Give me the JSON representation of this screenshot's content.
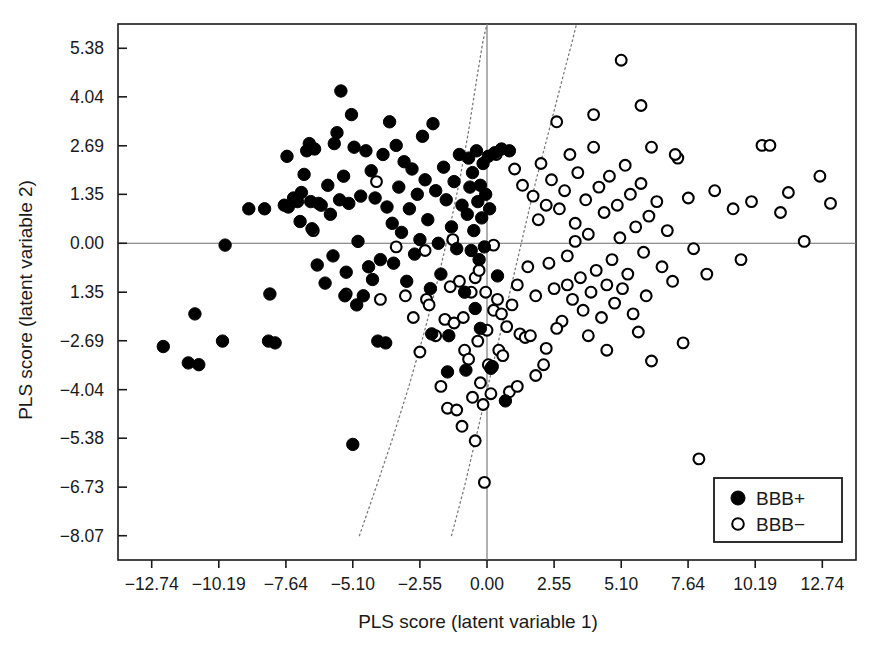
{
  "chart_data": {
    "type": "scatter",
    "title": "",
    "xlabel": "PLS score (latent variable 1)",
    "ylabel": "PLS score (latent variable 2)",
    "xlim": [
      -14.02,
      14.02
    ],
    "ylim": [
      -8.74,
      6.05
    ],
    "xticks": [
      -12.74,
      -10.19,
      -7.64,
      -5.1,
      -2.55,
      0.0,
      2.55,
      5.1,
      7.64,
      10.19,
      12.74
    ],
    "xticklabels": [
      "−12.74",
      "−10.19",
      "−7.64",
      "−5.10",
      "−2.55",
      "0.00",
      "2.55",
      "5.10",
      "7.64",
      "10.19",
      "12.74"
    ],
    "yticks": [
      5.38,
      4.04,
      2.69,
      1.35,
      0.0,
      -1.35,
      -2.69,
      -4.04,
      -5.38,
      -6.73,
      -8.07
    ],
    "yticklabels": [
      "5.38",
      "4.04",
      "2.69",
      "1.35",
      "0.00",
      "1.35",
      "−2.69",
      "−4.04",
      "−5.38",
      "−6.73",
      "−8.07"
    ],
    "grid": false,
    "zero_lines": {
      "x": 0.0,
      "y": 0.0
    },
    "legend_position": "lower-right",
    "series": [
      {
        "name": "BBB+",
        "marker": "filled-circle",
        "color": "#000000",
        "points": [
          [
            -12.3,
            -2.85
          ],
          [
            -11.35,
            -3.3
          ],
          [
            -11.1,
            -1.95
          ],
          [
            -10.95,
            -3.35
          ],
          [
            -10.05,
            -2.7
          ],
          [
            -9.95,
            -0.05
          ],
          [
            -9.05,
            0.95
          ],
          [
            -8.45,
            0.95
          ],
          [
            -8.3,
            -2.7
          ],
          [
            -8.25,
            -1.4
          ],
          [
            -8.05,
            -2.75
          ],
          [
            -7.7,
            1.05
          ],
          [
            -7.6,
            2.4
          ],
          [
            -7.55,
            1.0
          ],
          [
            -7.35,
            1.25
          ],
          [
            -7.2,
            1.15
          ],
          [
            -7.1,
            0.6
          ],
          [
            -7.05,
            1.4
          ],
          [
            -6.95,
            1.9
          ],
          [
            -6.85,
            2.55
          ],
          [
            -6.75,
            2.75
          ],
          [
            -6.7,
            1.15
          ],
          [
            -6.65,
            0.4
          ],
          [
            -6.55,
            2.6
          ],
          [
            -6.45,
            -0.6
          ],
          [
            -6.4,
            1.1
          ],
          [
            -6.3,
            1.05
          ],
          [
            -6.15,
            -1.1
          ],
          [
            -6.05,
            1.6
          ],
          [
            -5.95,
            0.8
          ],
          [
            -5.85,
            -0.35
          ],
          [
            -5.8,
            2.75
          ],
          [
            -5.7,
            3.05
          ],
          [
            -5.6,
            1.2
          ],
          [
            -5.55,
            4.2
          ],
          [
            -5.45,
            1.85
          ],
          [
            -5.4,
            -1.45
          ],
          [
            -5.35,
            -0.8
          ],
          [
            -5.25,
            1.1
          ],
          [
            -5.15,
            3.55
          ],
          [
            -5.1,
            -5.55
          ],
          [
            -5.05,
            2.65
          ],
          [
            -4.95,
            -1.7
          ],
          [
            -4.9,
            0.05
          ],
          [
            -4.8,
            1.3
          ],
          [
            -4.7,
            -1.45
          ],
          [
            -4.6,
            2.55
          ],
          [
            -4.5,
            -0.65
          ],
          [
            -4.4,
            2.0
          ],
          [
            -4.35,
            -1.0
          ],
          [
            -4.25,
            1.25
          ],
          [
            -4.15,
            -2.7
          ],
          [
            -4.05,
            -0.45
          ],
          [
            -3.95,
            2.45
          ],
          [
            -3.85,
            -2.75
          ],
          [
            -3.8,
            1.0
          ],
          [
            -3.7,
            3.35
          ],
          [
            -3.6,
            0.55
          ],
          [
            -3.55,
            -0.55
          ],
          [
            -3.45,
            2.7
          ],
          [
            -3.35,
            1.55
          ],
          [
            -3.25,
            0.3
          ],
          [
            -3.15,
            2.25
          ],
          [
            -3.05,
            -1.05
          ],
          [
            -2.95,
            0.95
          ],
          [
            -2.85,
            2.05
          ],
          [
            -2.75,
            -0.3
          ],
          [
            -2.65,
            1.35
          ],
          [
            -2.55,
            0.1
          ],
          [
            -2.45,
            2.95
          ],
          [
            -2.35,
            1.75
          ],
          [
            -2.25,
            0.65
          ],
          [
            -2.15,
            -1.25
          ],
          [
            -2.05,
            3.3
          ],
          [
            -1.95,
            1.45
          ],
          [
            -1.85,
            0.0
          ],
          [
            -1.75,
            -0.85
          ],
          [
            -1.65,
            2.1
          ],
          [
            -1.55,
            1.2
          ],
          [
            -1.45,
            -2.55
          ],
          [
            -1.35,
            0.45
          ],
          [
            -1.25,
            1.7
          ],
          [
            -1.15,
            -0.15
          ],
          [
            -1.05,
            2.45
          ],
          [
            -0.95,
            1.05
          ],
          [
            -0.85,
            -1.35
          ],
          [
            -0.75,
            0.8
          ],
          [
            -0.7,
            2.35
          ],
          [
            -0.65,
            1.55
          ],
          [
            -0.6,
            -0.2
          ],
          [
            -0.55,
            1.95
          ],
          [
            -0.5,
            0.35
          ],
          [
            -0.45,
            -1.8
          ],
          [
            -0.4,
            2.55
          ],
          [
            -0.35,
            1.15
          ],
          [
            -0.3,
            -0.45
          ],
          [
            -0.25,
            1.6
          ],
          [
            -0.2,
            0.7
          ],
          [
            -0.15,
            2.2
          ],
          [
            -0.1,
            -0.1
          ],
          [
            -0.05,
            1.35
          ],
          [
            0.05,
            2.4
          ],
          [
            0.1,
            0.95
          ],
          [
            0.2,
            -3.4
          ],
          [
            0.3,
            2.5
          ],
          [
            0.4,
            -0.9
          ],
          [
            0.55,
            2.6
          ],
          [
            0.7,
            -4.35
          ],
          [
            0.85,
            2.55
          ],
          [
            -1.5,
            -3.55
          ],
          [
            -0.8,
            -3.5
          ],
          [
            0.15,
            -3.45
          ],
          [
            -2.1,
            -2.5
          ],
          [
            -0.25,
            -2.35
          ]
        ]
      },
      {
        "name": "BBB−",
        "marker": "open-circle",
        "color": "#000000",
        "points": [
          [
            -5.35,
            -1.4
          ],
          [
            -4.2,
            1.7
          ],
          [
            -3.1,
            -1.45
          ],
          [
            -2.35,
            -0.2
          ],
          [
            -2.3,
            -1.55
          ],
          [
            -2.2,
            -1.7
          ],
          [
            -1.75,
            -3.95
          ],
          [
            -1.6,
            -2.1
          ],
          [
            -1.5,
            -4.55
          ],
          [
            -1.3,
            0.1
          ],
          [
            -1.25,
            -2.2
          ],
          [
            -1.15,
            -4.6
          ],
          [
            -0.95,
            -5.05
          ],
          [
            -0.85,
            -2.95
          ],
          [
            -0.7,
            -3.2
          ],
          [
            -0.6,
            -1.35
          ],
          [
            -0.55,
            -4.25
          ],
          [
            -0.45,
            -5.45
          ],
          [
            -0.35,
            -2.7
          ],
          [
            -0.25,
            -3.85
          ],
          [
            -0.15,
            -4.45
          ],
          [
            -0.1,
            -6.6
          ],
          [
            0.0,
            -2.4
          ],
          [
            0.05,
            -3.35
          ],
          [
            0.15,
            -4.15
          ],
          [
            0.25,
            -1.85
          ],
          [
            0.35,
            2.45
          ],
          [
            0.45,
            -2.95
          ],
          [
            0.6,
            -3.1
          ],
          [
            0.75,
            -2.3
          ],
          [
            0.85,
            -4.1
          ],
          [
            0.95,
            -1.7
          ],
          [
            1.05,
            2.05
          ],
          [
            1.15,
            -1.15
          ],
          [
            1.25,
            -2.5
          ],
          [
            1.35,
            1.6
          ],
          [
            1.45,
            -2.6
          ],
          [
            1.55,
            -0.65
          ],
          [
            1.65,
            -2.55
          ],
          [
            1.75,
            1.3
          ],
          [
            1.85,
            -1.45
          ],
          [
            1.95,
            0.65
          ],
          [
            2.05,
            2.2
          ],
          [
            2.15,
            -3.35
          ],
          [
            2.25,
            1.05
          ],
          [
            2.35,
            -0.55
          ],
          [
            2.45,
            1.75
          ],
          [
            2.55,
            -1.25
          ],
          [
            2.65,
            3.35
          ],
          [
            2.75,
            0.95
          ],
          [
            2.85,
            -2.15
          ],
          [
            2.95,
            1.45
          ],
          [
            3.05,
            -0.35
          ],
          [
            3.15,
            2.45
          ],
          [
            3.25,
            -1.55
          ],
          [
            3.35,
            0.55
          ],
          [
            3.45,
            1.95
          ],
          [
            3.55,
            -0.95
          ],
          [
            3.65,
            -1.85
          ],
          [
            3.75,
            1.2
          ],
          [
            3.85,
            0.25
          ],
          [
            3.95,
            -1.35
          ],
          [
            4.05,
            2.65
          ],
          [
            4.15,
            -0.75
          ],
          [
            4.25,
            1.55
          ],
          [
            4.35,
            -2.05
          ],
          [
            4.45,
            0.85
          ],
          [
            4.55,
            -1.15
          ],
          [
            4.65,
            1.85
          ],
          [
            4.75,
            -0.45
          ],
          [
            4.85,
            -1.65
          ],
          [
            4.95,
            1.05
          ],
          [
            5.05,
            0.15
          ],
          [
            5.15,
            -1.25
          ],
          [
            5.25,
            2.15
          ],
          [
            5.35,
            -0.85
          ],
          [
            5.45,
            1.35
          ],
          [
            5.55,
            -1.95
          ],
          [
            5.65,
            0.45
          ],
          [
            5.75,
            -2.45
          ],
          [
            5.85,
            1.65
          ],
          [
            5.95,
            -0.25
          ],
          [
            6.05,
            -1.45
          ],
          [
            6.15,
            0.75
          ],
          [
            6.25,
            -3.25
          ],
          [
            6.45,
            1.15
          ],
          [
            6.65,
            -0.65
          ],
          [
            6.85,
            0.35
          ],
          [
            7.05,
            -1.05
          ],
          [
            7.25,
            2.35
          ],
          [
            7.45,
            -2.75
          ],
          [
            7.65,
            1.25
          ],
          [
            7.85,
            -0.15
          ],
          [
            8.05,
            -5.95
          ],
          [
            8.35,
            -0.85
          ],
          [
            8.65,
            1.45
          ],
          [
            9.05,
            -7.45
          ],
          [
            9.35,
            0.95
          ],
          [
            9.65,
            -0.45
          ],
          [
            10.05,
            1.15
          ],
          [
            10.45,
            2.7
          ],
          [
            10.75,
            2.7
          ],
          [
            11.15,
            0.85
          ],
          [
            11.45,
            1.4
          ],
          [
            12.05,
            0.05
          ],
          [
            12.65,
            1.85
          ],
          [
            13.05,
            1.1
          ],
          [
            5.1,
            5.05
          ],
          [
            4.05,
            3.55
          ],
          [
            6.25,
            2.65
          ],
          [
            7.15,
            2.45
          ],
          [
            5.85,
            3.8
          ],
          [
            3.35,
            0.05
          ],
          [
            2.25,
            -2.9
          ],
          [
            1.15,
            -3.95
          ],
          [
            0.55,
            -1.95
          ],
          [
            -0.05,
            -1.35
          ],
          [
            0.25,
            -0.05
          ],
          [
            -0.45,
            -0.95
          ],
          [
            1.85,
            -3.65
          ],
          [
            3.85,
            -2.55
          ],
          [
            4.55,
            -2.95
          ],
          [
            2.65,
            -2.35
          ],
          [
            3.05,
            -1.15
          ],
          [
            -2.8,
            -2.05
          ],
          [
            -2.55,
            -3.0
          ],
          [
            -1.05,
            -1.05
          ],
          [
            -0.9,
            -2.05
          ],
          [
            -1.95,
            -2.55
          ],
          [
            -1.4,
            -1.2
          ],
          [
            -0.3,
            -0.75
          ],
          [
            0.4,
            -1.55
          ],
          [
            -4.05,
            -1.55
          ],
          [
            -3.45,
            -0.1
          ],
          [
            -6.6,
            0.35
          ]
        ]
      }
    ],
    "boundaries": [
      {
        "name": "decision-boundary-left",
        "style": "dotted",
        "points": [
          [
            -4.85,
            -8.07
          ],
          [
            -4.2,
            -6.7
          ],
          [
            -3.55,
            -5.3
          ],
          [
            -2.95,
            -3.9
          ],
          [
            -2.4,
            -2.5
          ],
          [
            -1.9,
            -1.1
          ],
          [
            -1.45,
            0.3
          ],
          [
            -1.05,
            1.7
          ],
          [
            -0.7,
            3.1
          ],
          [
            -0.4,
            4.5
          ],
          [
            -0.15,
            5.6
          ],
          [
            0.0,
            6.05
          ]
        ],
        "label": ""
      },
      {
        "name": "decision-boundary-right",
        "style": "dotted",
        "points": [
          [
            -1.35,
            -8.07
          ],
          [
            -0.85,
            -6.7
          ],
          [
            -0.4,
            -5.3
          ],
          [
            0.05,
            -3.9
          ],
          [
            0.5,
            -2.5
          ],
          [
            0.95,
            -1.1
          ],
          [
            1.4,
            0.3
          ],
          [
            1.85,
            1.7
          ],
          [
            2.35,
            3.1
          ],
          [
            2.85,
            4.5
          ],
          [
            3.25,
            5.6
          ],
          [
            3.4,
            6.05
          ]
        ],
        "label": ""
      }
    ],
    "legend": [
      {
        "label": "BBB+",
        "marker": "filled-circle"
      },
      {
        "label": "BBB−",
        "marker": "open-circle"
      }
    ]
  },
  "colors": {
    "axis": "#1a1a1a",
    "marker": "#000000",
    "zero_line": "#6e6e6e",
    "boundary": "#7a7a7a",
    "background": "#ffffff"
  }
}
